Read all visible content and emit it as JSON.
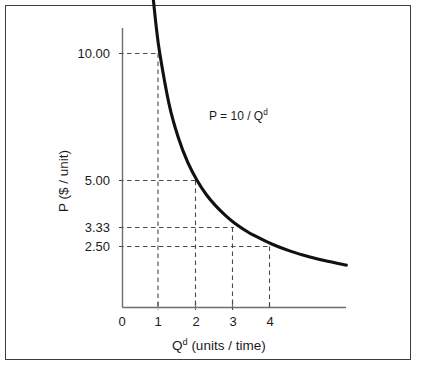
{
  "chart_data": {
    "type": "line",
    "title": "",
    "xlabel": "Qd (units / time)",
    "ylabel": "P ($ / unit)",
    "annotation": "P = 10 / Qd",
    "equation": "P = 10 / Q",
    "equation_exponent": "d",
    "xlabel_base": "Q",
    "xlabel_exponent": "d",
    "xlabel_rest": " (units / time)",
    "ylabel_text": "P ($ / unit)",
    "grid": false,
    "dashed_guides": true,
    "legend": "none",
    "xlim": [
      0,
      6.1
    ],
    "ylim": [
      0,
      12.6
    ],
    "x_ticks": [
      "0",
      "1",
      "2",
      "3",
      "4"
    ],
    "x_tick_values": [
      0,
      1,
      2,
      3,
      4
    ],
    "y_ticks": [
      "10.00",
      "5.00",
      "3.33",
      "2.50"
    ],
    "y_tick_values": [
      10.0,
      5.0,
      3.33,
      2.5
    ],
    "series": [
      {
        "name": "Demand curve P = 10 / Qd",
        "formula": "P = 10 / Q",
        "color": "#111111",
        "x": [
          0.79,
          0.9,
          1.0,
          1.25,
          1.5,
          1.75,
          2.0,
          2.25,
          2.5,
          2.75,
          3.0,
          3.33,
          3.5,
          4.0,
          4.5,
          5.0,
          5.5,
          6.0
        ],
        "y": [
          12.66,
          11.11,
          10.0,
          8.0,
          6.67,
          5.71,
          5.0,
          4.44,
          4.0,
          3.64,
          3.33,
          3.0,
          2.86,
          2.5,
          2.22,
          2.0,
          1.82,
          1.67
        ]
      }
    ],
    "guide_points": [
      {
        "x": 1,
        "y": 10.0,
        "x_label": "1",
        "y_label": "10.00"
      },
      {
        "x": 2,
        "y": 5.0,
        "x_label": "2",
        "y_label": "5.00"
      },
      {
        "x": 3,
        "y": 3.33,
        "x_label": "3",
        "y_label": "3.33"
      },
      {
        "x": 4,
        "y": 2.5,
        "x_label": "4",
        "y_label": "2.50"
      }
    ]
  },
  "axes": {
    "y_labels": [
      "10.00",
      "5.00",
      "3.33",
      "2.50"
    ],
    "x_labels": [
      "0",
      "1",
      "2",
      "3",
      "4"
    ],
    "y_title": "P ($ / unit)",
    "x_title_base": "Q",
    "x_title_sup": "d",
    "x_title_tail": " (units / time)"
  },
  "annotation": {
    "equation_base": "P = 10 / Q",
    "equation_sup": "d"
  },
  "colors": {
    "frame": "#3c3c3c",
    "axis": "#6e6e6e",
    "curve": "#111111",
    "guide": "#4a4a4a",
    "text": "#1b1b1b",
    "background": "#ffffff"
  }
}
